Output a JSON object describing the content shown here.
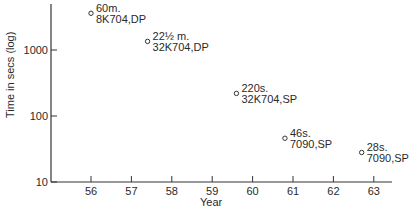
{
  "chart_data": {
    "type": "scatter",
    "title": "",
    "xlabel": "Year",
    "ylabel": "Time in secs (log)",
    "yscale": "log",
    "xlim": [
      55,
      63.5
    ],
    "ylim": [
      10,
      5000
    ],
    "x_ticks": [
      "56",
      "57",
      "58",
      "59",
      "60",
      "61",
      "62",
      "63"
    ],
    "y_ticks": [
      "10",
      "100",
      "1000"
    ],
    "grid": false,
    "points": [
      {
        "year": 56.0,
        "seconds": 3600,
        "label_line1": "60m.",
        "label_line2": "8K704,DP"
      },
      {
        "year": 57.4,
        "seconds": 1350,
        "label_line1": "22½ m.",
        "label_line2": "32K704,DP"
      },
      {
        "year": 59.6,
        "seconds": 220,
        "label_line1": "220s.",
        "label_line2": "32K704,SP"
      },
      {
        "year": 60.8,
        "seconds": 46,
        "label_line1": "46s.",
        "label_line2": "7090,SP"
      },
      {
        "year": 62.7,
        "seconds": 28,
        "label_line1": "28s.",
        "label_line2": "7090,SP"
      }
    ]
  }
}
